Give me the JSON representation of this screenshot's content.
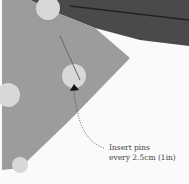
{
  "image": {
    "description": "Close-up of grey polka-dot fabric folded over with a pin inserted, with an annotation arrow",
    "colors": {
      "fabric": "#9c9c9c",
      "dots": "#d8d8d8",
      "dark_fabric": "#4a4a4a",
      "background": "#fafafa"
    }
  },
  "annotation": {
    "line1": "Insert pins",
    "line2": "every 2.5cm (1in)"
  }
}
